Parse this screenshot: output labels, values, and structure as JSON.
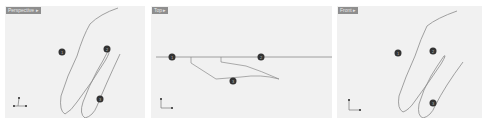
{
  "viewports": [
    {
      "label": "Perspective ▸",
      "markers": [
        "1",
        "2",
        "3"
      ]
    },
    {
      "label": "Top ▸",
      "markers": [
        "1",
        "2",
        "3"
      ]
    },
    {
      "label": "Front ▸",
      "markers": [
        "1",
        "2",
        "3"
      ]
    }
  ],
  "axis": {
    "x": "x",
    "y": "y",
    "z": "z"
  },
  "colors": {
    "viewport_bg": "#f1f1f1",
    "curve": "#8a8a8a",
    "marker": "#333333",
    "label_bg": "#8e8e8e"
  }
}
